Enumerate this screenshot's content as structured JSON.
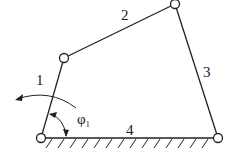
{
  "diagram": {
    "type": "four-bar linkage",
    "links": [
      {
        "id": "1",
        "label": "1"
      },
      {
        "id": "2",
        "label": "2"
      },
      {
        "id": "3",
        "label": "3"
      },
      {
        "id": "4",
        "label": "4"
      }
    ],
    "angle": {
      "symbol": "φ",
      "subscript": "1"
    },
    "joints": {
      "A": [
        41,
        138
      ],
      "B": [
        64,
        58
      ],
      "C": [
        175,
        4
      ],
      "D": [
        218,
        138
      ]
    },
    "colors": {
      "line": "#222222",
      "background": "#ffffff"
    }
  }
}
